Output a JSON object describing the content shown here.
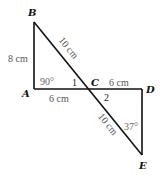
{
  "diagram": {
    "type": "geometry-figure",
    "points": {
      "A": {
        "label": "A",
        "x": 34,
        "y": 89
      },
      "B": {
        "label": "B",
        "x": 34,
        "y": 22
      },
      "C": {
        "label": "C",
        "x": 88,
        "y": 89
      },
      "D": {
        "label": "D",
        "x": 142,
        "y": 89
      },
      "E": {
        "label": "E",
        "x": 142,
        "y": 155
      }
    },
    "segments": [
      {
        "from": "A",
        "to": "B"
      },
      {
        "from": "A",
        "to": "D"
      },
      {
        "from": "D",
        "to": "E"
      },
      {
        "from": "B",
        "to": "E"
      }
    ],
    "measurements": {
      "AB": "8 cm",
      "BC": "10 cm",
      "AC": "6 cm",
      "CD": "6 cm",
      "CE": "10 cm"
    },
    "angles": {
      "A": "90°",
      "angle1": "1",
      "angle2": "2",
      "E": "37°"
    },
    "colors": {
      "line": "#111111",
      "measurement_text": "#555555"
    }
  }
}
